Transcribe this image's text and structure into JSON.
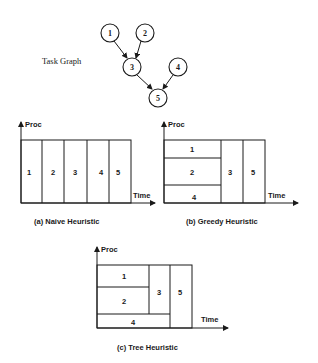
{
  "task_graph": {
    "label": "Task Graph",
    "nodes": [
      {
        "id": "1",
        "x": 110,
        "y": 33
      },
      {
        "id": "2",
        "x": 145,
        "y": 33
      },
      {
        "id": "3",
        "x": 132,
        "y": 67
      },
      {
        "id": "4",
        "x": 178,
        "y": 67
      },
      {
        "id": "5",
        "x": 158,
        "y": 98
      }
    ],
    "edges": [
      {
        "from": "1",
        "to": "3"
      },
      {
        "from": "2",
        "to": "3"
      },
      {
        "from": "3",
        "to": "5"
      },
      {
        "from": "4",
        "to": "5"
      }
    ]
  },
  "schedules": [
    {
      "caption": "(a) Naive Heuristic",
      "y_axis": "Proc",
      "x_axis": "Time",
      "tasks": [
        "1",
        "2",
        "3",
        "4",
        "5"
      ]
    },
    {
      "caption": "(b) Greedy Heuristic",
      "y_axis": "Proc",
      "x_axis": "Time",
      "tasks": [
        "1",
        "2",
        "4",
        "3",
        "5"
      ]
    },
    {
      "caption": "(c) Tree Heuristic",
      "y_axis": "Proc",
      "x_axis": "Time",
      "tasks": [
        "1",
        "2",
        "3",
        "4",
        "5"
      ]
    }
  ],
  "colors": {
    "ink": "#1a1a1a",
    "background": "#ffffff"
  }
}
